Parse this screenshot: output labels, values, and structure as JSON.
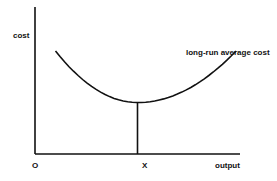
{
  "chart_data": {
    "type": "line",
    "title": "",
    "xlabel": "output",
    "ylabel": "cost",
    "origin_label": "O",
    "x_marker_label": "X",
    "series": [
      {
        "name": "long-run average cost",
        "shape": "U-shaped",
        "points": [
          [
            0.1,
            0.7
          ],
          [
            0.3,
            0.42
          ],
          [
            0.5,
            0.35
          ],
          [
            0.7,
            0.42
          ],
          [
            0.98,
            0.7
          ]
        ]
      }
    ],
    "minimum": {
      "x_label": "X",
      "x": 0.5,
      "y": 0.35
    },
    "xlim": [
      0,
      1
    ],
    "ylim": [
      0,
      1
    ],
    "grid": false,
    "legend": "none"
  }
}
